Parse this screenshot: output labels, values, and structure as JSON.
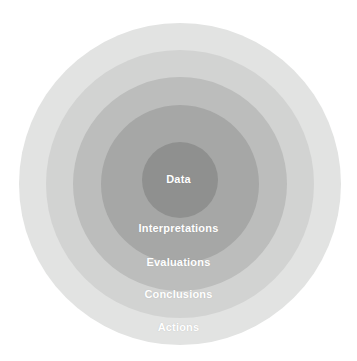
{
  "diagram": {
    "type": "concentric-circles",
    "background_color": "#ffffff",
    "label_color": "#ffffff",
    "rings": [
      {
        "id": "actions",
        "label": "Actions",
        "level": 5,
        "position": "outermost",
        "color": "#e2e3e2"
      },
      {
        "id": "conclusions",
        "label": "Conclusions",
        "level": 4,
        "color": "#d2d3d2"
      },
      {
        "id": "evaluations",
        "label": "Evaluations",
        "level": 3,
        "color": "#bcbdbc"
      },
      {
        "id": "interpretations",
        "label": "Interpretations",
        "level": 2,
        "color": "#a6a7a6"
      },
      {
        "id": "data",
        "label": "Data",
        "level": 1,
        "position": "innermost",
        "color": "#8f908f"
      }
    ]
  }
}
